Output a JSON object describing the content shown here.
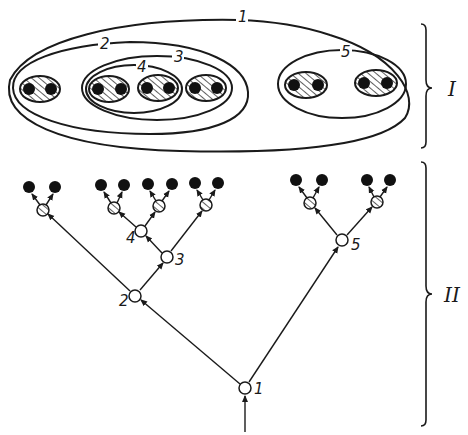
{
  "figure": {
    "type": "nested-sets-and-tree",
    "colors": {
      "ink": "#1a1a1a",
      "background": "#ffffff"
    },
    "part_labels": {
      "top": "I",
      "bottom": "II"
    },
    "sets": [
      {
        "id": "1",
        "label": "1",
        "contains": [
          "2",
          "5"
        ]
      },
      {
        "id": "2",
        "label": "2",
        "contains": [
          "pair-a",
          "3"
        ]
      },
      {
        "id": "3",
        "label": "3",
        "contains": [
          "4",
          "pair-d"
        ]
      },
      {
        "id": "4",
        "label": "4",
        "contains": [
          "pair-b",
          "pair-c"
        ]
      },
      {
        "id": "5",
        "label": "5",
        "contains": [
          "pair-e",
          "pair-f"
        ]
      }
    ],
    "hatched_pairs": [
      "pair-a",
      "pair-b",
      "pair-c",
      "pair-d",
      "pair-e",
      "pair-f"
    ],
    "tree": {
      "root": "1",
      "nodes": [
        {
          "id": "1",
          "label": "1",
          "style": "open-circle"
        },
        {
          "id": "2",
          "label": "2",
          "style": "open-circle"
        },
        {
          "id": "3",
          "label": "3",
          "style": "open-circle"
        },
        {
          "id": "4",
          "label": "4",
          "style": "open-circle"
        },
        {
          "id": "5",
          "label": "5",
          "style": "open-circle"
        }
      ],
      "edges": [
        [
          "1",
          "2"
        ],
        [
          "1",
          "5"
        ],
        [
          "2",
          "pair-a"
        ],
        [
          "2",
          "3"
        ],
        [
          "3",
          "4"
        ],
        [
          "3",
          "pair-d"
        ],
        [
          "4",
          "pair-b"
        ],
        [
          "4",
          "pair-c"
        ],
        [
          "5",
          "pair-e"
        ],
        [
          "5",
          "pair-f"
        ]
      ],
      "leaf_style": "filled-circle",
      "pair_node_style": "hatched-circle"
    }
  }
}
